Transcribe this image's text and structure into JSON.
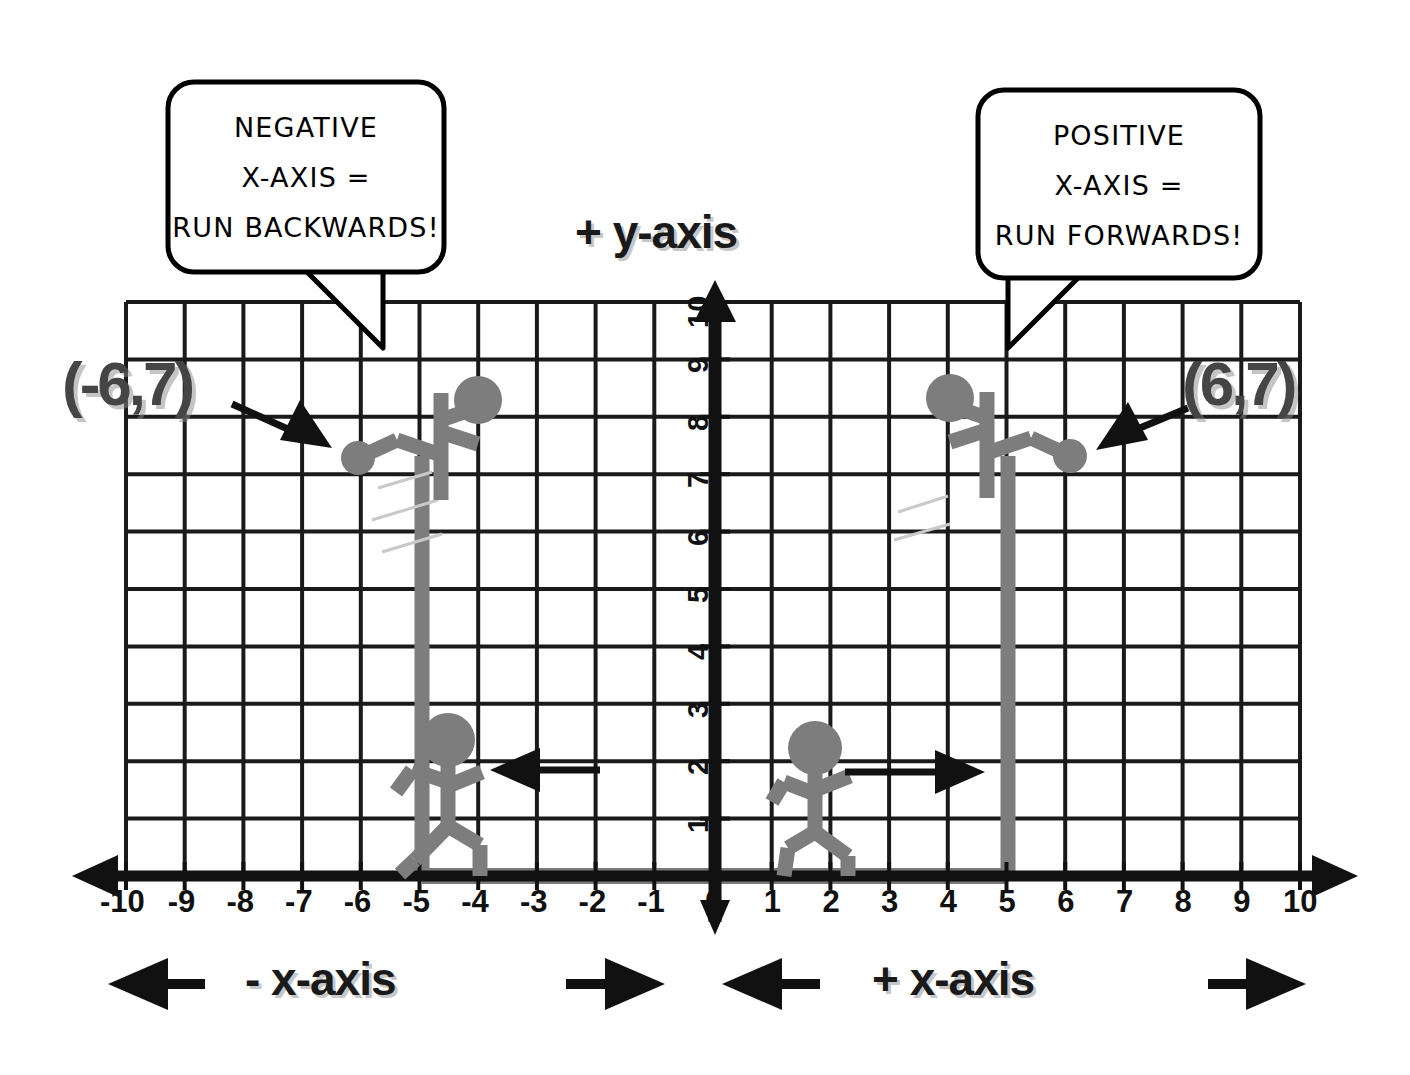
{
  "colors": {
    "background": "#ffffff",
    "grid": "#1a1a1a",
    "axis_black": "#111111",
    "axis_gray": "#7a7a7a",
    "figure_gray": "#7d7d7d",
    "label_gray": "#454545",
    "bubble_outline": "#000000",
    "bubble_fill": "#ffffff"
  },
  "axis_titles": {
    "y": "+ y-axis",
    "x_negative": "- x-axis",
    "x_positive": "+ x-axis"
  },
  "speech_bubbles": [
    {
      "id": "negative-bubble",
      "lines": [
        "NEGATIVE",
        "X-AXIS =",
        "RUN BACKWARDS!"
      ],
      "points_to": "x = -6 on grid"
    },
    {
      "id": "positive-bubble",
      "lines": [
        "POSITIVE",
        "X-AXIS =",
        "RUN FORWARDS!"
      ],
      "points_to": "x = 5 on grid"
    }
  ],
  "point_labels": [
    {
      "id": "left-point-label",
      "text": "(-6,7)",
      "x": -6,
      "y": 7
    },
    {
      "id": "right-point-label",
      "text": "(6,7)",
      "x": 6,
      "y": 7
    }
  ],
  "chart_data": {
    "type": "scatter",
    "xlabel": "x-axis",
    "ylabel": "y-axis",
    "xlim": [
      -10,
      10
    ],
    "ylim": [
      0,
      10
    ],
    "grid": true,
    "xticks": [
      -10,
      -9,
      -8,
      -7,
      -6,
      -5,
      -4,
      -3,
      -2,
      -1,
      0,
      1,
      2,
      3,
      4,
      5,
      6,
      7,
      8,
      9,
      10
    ],
    "xtick_labels": [
      "-10",
      "-9",
      "-8",
      "-7",
      "-6",
      "-5",
      "-4",
      "-3",
      "-2",
      "-1",
      "0",
      "1",
      "2",
      "3",
      "4",
      "5",
      "6",
      "7",
      "8",
      "9",
      "10"
    ],
    "yticks": [
      1,
      2,
      3,
      4,
      5,
      6,
      7,
      8,
      9,
      10
    ],
    "ytick_labels": [
      "1",
      "2",
      "3",
      "4",
      "5",
      "6",
      "7",
      "8",
      "9",
      "10"
    ],
    "points": [
      {
        "label": "(-6,7)",
        "x": -6,
        "y": 7
      },
      {
        "label": "(6,7)",
        "x": 6,
        "y": 7
      }
    ],
    "annotations": [
      {
        "text": "NEGATIVE X-AXIS = RUN BACKWARDS!",
        "target_x": -6
      },
      {
        "text": "POSITIVE X-AXIS = RUN FORWARDS!",
        "target_x": 5
      },
      {
        "text": "- x-axis",
        "direction": "left"
      },
      {
        "text": "+ x-axis",
        "direction": "right"
      },
      {
        "text": "+ y-axis",
        "direction": "up"
      }
    ],
    "figures": [
      {
        "name": "climber-left",
        "x": -6,
        "y": 7,
        "facing": "right"
      },
      {
        "name": "climber-right",
        "x": 6,
        "y": 7,
        "facing": "left"
      },
      {
        "name": "runner-left",
        "x": -4,
        "y": 1,
        "facing": "left",
        "arrow": "left"
      },
      {
        "name": "runner-right",
        "x": 2,
        "y": 1,
        "facing": "right",
        "arrow": "right"
      }
    ],
    "highlight_segments": [
      {
        "from_x": -6,
        "to_x": 6,
        "on": "x-axis",
        "color": "#7a7a7a"
      },
      {
        "name": "drop-line-left",
        "x": -6,
        "from_y": 0,
        "to_y": 7
      },
      {
        "name": "drop-line-right",
        "x": 6,
        "from_y": 0,
        "to_y": 7
      }
    ]
  }
}
